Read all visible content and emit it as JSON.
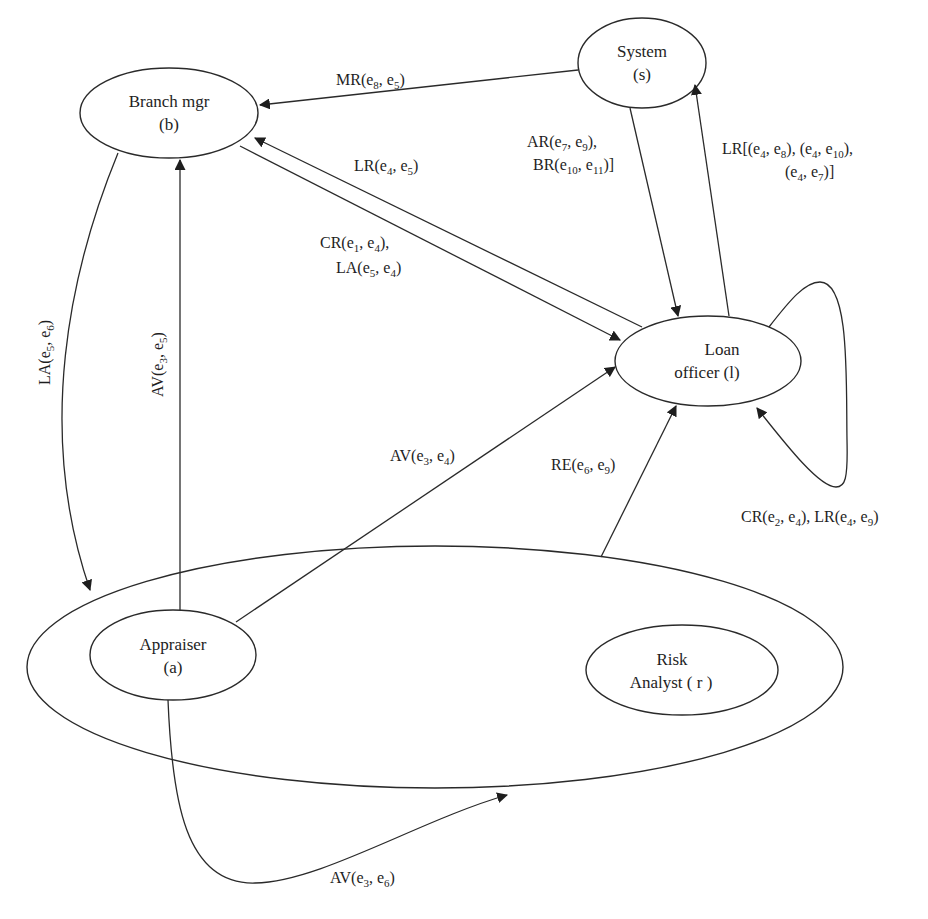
{
  "diagram": {
    "type": "role-interaction-diagram",
    "nodes": {
      "system": {
        "line1": "System",
        "line2": "(s)"
      },
      "branch_mgr": {
        "line1": "Branch mgr",
        "line2": "(b)"
      },
      "loan_officer": {
        "line1": "Loan",
        "line2": "officer (l)"
      },
      "appraiser": {
        "line1": "Appraiser",
        "line2": "(a)"
      },
      "risk_analyst": {
        "line1": "Risk",
        "line2": "Analyst ( r )"
      }
    },
    "edges": [
      {
        "id": "mr",
        "from": "System",
        "to": "Branch mgr",
        "label": "MR(e8, e5)"
      },
      {
        "id": "lr_l_b",
        "from": "Loan officer",
        "to": "Branch mgr",
        "label": "LR(e4, e5)"
      },
      {
        "id": "cr_la_b_l",
        "from": "Branch mgr",
        "to": "Loan officer",
        "label": "CR(e1, e4), LA(e5, e4)"
      },
      {
        "id": "ar_br",
        "from": "System",
        "to": "Loan officer",
        "label": "AR(e7, e9), BR(e10, e11)]"
      },
      {
        "id": "lr_l_s",
        "from": "Loan officer",
        "to": "System",
        "label": "LR[(e4, e8), (e4, e10), (e4, e7)]"
      },
      {
        "id": "self_loop",
        "from": "Loan officer",
        "to": "Loan officer",
        "label": "CR(e2, e4), LR(e4, e9)"
      },
      {
        "id": "la_b_group",
        "from": "Branch mgr",
        "to": "Appraiser/Risk Analyst group",
        "label": "LA(e5, e6)"
      },
      {
        "id": "av_a_b",
        "from": "Appraiser",
        "to": "Branch mgr",
        "label": "AV(e3, e5)"
      },
      {
        "id": "av_a_l",
        "from": "Appraiser",
        "to": "Loan officer",
        "label": "AV(e3, e4)"
      },
      {
        "id": "re",
        "from": "Appraiser/Risk Analyst group",
        "to": "Loan officer",
        "label": "RE(e6, e9)"
      },
      {
        "id": "av_a_group",
        "from": "Appraiser",
        "to": "Appraiser/Risk Analyst group",
        "label": "AV(e3, e6)"
      }
    ],
    "labels": {
      "mr": {
        "a": "MR(e",
        "s1": "8",
        "b": ", e",
        "s2": "5",
        "c": ")"
      },
      "lr_l_b": {
        "a": "LR(e",
        "s1": "4",
        "b": ", e",
        "s2": "5",
        "c": ")"
      },
      "cr_line1": {
        "a": "CR(e",
        "s1": "1",
        "b": ", e",
        "s2": "4",
        "c": "),"
      },
      "la_line2": {
        "a": "LA(e",
        "s1": "5",
        "b": ", e",
        "s2": "4",
        "c": ")"
      },
      "ar_line1": {
        "a": "AR(e",
        "s1": "7",
        "b": ", e",
        "s2": "9",
        "c": "),"
      },
      "br_line2": {
        "a": "BR(e",
        "s1": "10",
        "b": ", e",
        "s2": "11",
        "c": ")]"
      },
      "lr_s_line1": {
        "a": "LR[(e",
        "s1": "4",
        "b": ", e",
        "s2": "8",
        "c": "), (e",
        "s3": "4",
        "d": ", e",
        "s4": "10",
        "e": "),"
      },
      "lr_s_line2": {
        "a": "(e",
        "s1": "4",
        "b": ", e",
        "s2": "7",
        "c": ")]"
      },
      "self_loop": {
        "a": "CR(e",
        "s1": "2",
        "b": ", e",
        "s2": "4",
        "c": "), LR(e",
        "s3": "4",
        "d": ", e",
        "s4": "9",
        "e": ")"
      },
      "la_b_group": {
        "a": "LA(e",
        "s1": "5",
        "b": ", e",
        "s2": "6",
        "c": ")"
      },
      "av_a_b": {
        "a": "AV(e",
        "s1": "3",
        "b": ", e",
        "s2": "5",
        "c": ")"
      },
      "av_a_l": {
        "a": "AV(e",
        "s1": "3",
        "b": ", e",
        "s2": "4",
        "c": ")"
      },
      "re": {
        "a": "RE(e",
        "s1": "6",
        "b": ", e",
        "s2": "9",
        "c": ")"
      },
      "av_a_group": {
        "a": "AV(e",
        "s1": "3",
        "b": ", e",
        "s2": "6",
        "c": ")"
      }
    },
    "colors": {
      "stroke": "#2a2a2a",
      "text": "#1e1e1e",
      "background": "#ffffff"
    }
  }
}
